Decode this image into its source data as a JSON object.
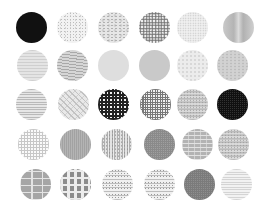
{
  "swatch_size": 31,
  "swatches": [
    {
      "row": 1,
      "col": 1,
      "x": 31,
      "y": 27,
      "pattern": "solid-black",
      "label": "Solid black"
    },
    {
      "row": 1,
      "col": 2,
      "x": 72,
      "y": 27,
      "pattern": "speckle-light",
      "label": "Light speckle"
    },
    {
      "row": 1,
      "col": 3,
      "x": 113,
      "y": 27,
      "pattern": "marble",
      "label": "Marble"
    },
    {
      "row": 1,
      "col": 4,
      "x": 154,
      "y": 27,
      "pattern": "granite",
      "label": "Granite"
    },
    {
      "row": 1,
      "col": 5,
      "x": 192,
      "y": 27,
      "pattern": "speckle-fine",
      "label": "Fine speckle"
    },
    {
      "row": 1,
      "col": 6,
      "x": 238,
      "y": 27,
      "pattern": "brushed",
      "label": "Brushed metal"
    },
    {
      "row": 2,
      "col": 1,
      "x": 32,
      "y": 65,
      "pattern": "wavy",
      "label": "Wavy light"
    },
    {
      "row": 2,
      "col": 2,
      "x": 72,
      "y": 65,
      "pattern": "wavy-dark",
      "label": "Wavy"
    },
    {
      "row": 2,
      "col": 3,
      "x": 113,
      "y": 65,
      "pattern": "flat-light",
      "label": "Flat light gray"
    },
    {
      "row": 2,
      "col": 4,
      "x": 154,
      "y": 65,
      "pattern": "flat-mid",
      "label": "Flat mid gray"
    },
    {
      "row": 2,
      "col": 5,
      "x": 192,
      "y": 65,
      "pattern": "flat-pale",
      "label": "Pale mottled"
    },
    {
      "row": 2,
      "col": 6,
      "x": 232,
      "y": 65,
      "pattern": "mottled",
      "label": "Mottled"
    },
    {
      "row": 3,
      "col": 1,
      "x": 31,
      "y": 104,
      "pattern": "hlines",
      "label": "Horizontal lines"
    },
    {
      "row": 3,
      "col": 2,
      "x": 73,
      "y": 104,
      "pattern": "crackle",
      "label": "Crackle"
    },
    {
      "row": 3,
      "col": 3,
      "x": 113,
      "y": 104,
      "pattern": "check-dark",
      "label": "Dark check"
    },
    {
      "row": 3,
      "col": 4,
      "x": 155,
      "y": 104,
      "pattern": "grid-mid",
      "label": "Grid"
    },
    {
      "row": 3,
      "col": 5,
      "x": 192,
      "y": 104,
      "pattern": "noise",
      "label": "Noise"
    },
    {
      "row": 3,
      "col": 6,
      "x": 232,
      "y": 104,
      "pattern": "grid-dark",
      "label": "Dark grid"
    },
    {
      "row": 4,
      "col": 1,
      "x": 33,
      "y": 144,
      "pattern": "dotgrid",
      "label": "Dot grid"
    },
    {
      "row": 4,
      "col": 2,
      "x": 75,
      "y": 144,
      "pattern": "fine-grey",
      "label": "Fine gray"
    },
    {
      "row": 4,
      "col": 3,
      "x": 116,
      "y": 144,
      "pattern": "scribble",
      "label": "Scribble"
    },
    {
      "row": 4,
      "col": 4,
      "x": 159,
      "y": 144,
      "pattern": "grid-grey",
      "label": "Gray grid"
    },
    {
      "row": 4,
      "col": 5,
      "x": 197,
      "y": 144,
      "pattern": "bricks-small",
      "label": "Small bricks"
    },
    {
      "row": 4,
      "col": 6,
      "x": 233,
      "y": 144,
      "pattern": "noise",
      "label": "Noise dark"
    },
    {
      "row": 5,
      "col": 1,
      "x": 35,
      "y": 184,
      "pattern": "bricks",
      "label": "Bricks"
    },
    {
      "row": 5,
      "col": 2,
      "x": 75,
      "y": 184,
      "pattern": "tiles",
      "label": "Tiles"
    },
    {
      "row": 5,
      "col": 3,
      "x": 117,
      "y": 184,
      "pattern": "script",
      "label": "Script text"
    },
    {
      "row": 5,
      "col": 4,
      "x": 159,
      "y": 184,
      "pattern": "script",
      "label": "Script text 2"
    },
    {
      "row": 5,
      "col": 5,
      "x": 199,
      "y": 184,
      "pattern": "dark-grid-grey",
      "label": "Dark gray grid"
    },
    {
      "row": 5,
      "col": 6,
      "x": 236,
      "y": 184,
      "pattern": "lines-pale",
      "label": "Pale lines"
    }
  ]
}
